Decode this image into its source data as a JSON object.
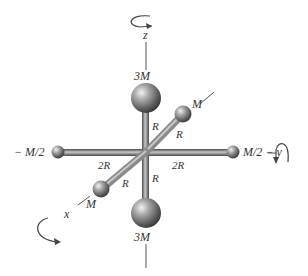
{
  "diagram": {
    "axes": {
      "z": {
        "label": "z",
        "rotation": "counterclockwise-about-z"
      },
      "y": {
        "label": "y",
        "rotation": "about-y"
      },
      "x": {
        "label": "x",
        "rotation": "about-x"
      }
    },
    "masses": {
      "top": {
        "label": "3M"
      },
      "bottom": {
        "label": "3M"
      },
      "left": {
        "label": "− M/2"
      },
      "right": {
        "label": "M/2 − y"
      },
      "upper_right": {
        "label": "M"
      },
      "lower_left": {
        "label": "M"
      }
    },
    "rods": {
      "top": {
        "label": "R"
      },
      "bottom": {
        "label": "R"
      },
      "upper_right": {
        "label": "R"
      },
      "lower_left": {
        "label": "R"
      },
      "left": {
        "label": "2R"
      },
      "right": {
        "label": "2R"
      }
    },
    "colors": {
      "rod": "#8a8a8a",
      "sphere": "#7a7a7a",
      "line": "#555555",
      "text": "#333333"
    }
  }
}
